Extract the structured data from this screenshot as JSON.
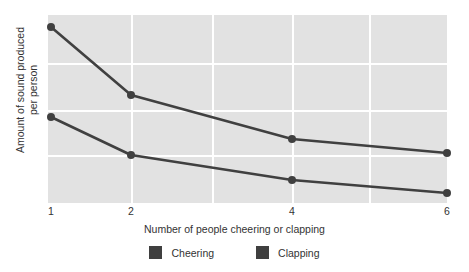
{
  "chart_data": {
    "type": "line",
    "title": "",
    "xlabel": "Number of people cheering or clapping",
    "ylabel": "Amount of sound produced per person",
    "ylabel_line1": "Amount of sound produced",
    "ylabel_line2": "per person",
    "x": [
      1,
      2,
      4,
      6
    ],
    "xticklabels": [
      "1",
      "2",
      "4",
      "6"
    ],
    "yticklabels": [],
    "xlim": [
      1,
      6
    ],
    "ylim": [
      0,
      10
    ],
    "grid": true,
    "legend_position": "bottom",
    "plot_background": "#e2e2e2",
    "gridline_color": "#ffffff",
    "series": [
      {
        "name": "Cheering",
        "color": "#404040",
        "values": [
          9.4,
          5.75,
          3.4,
          2.65
        ],
        "pixel_y": [
          27,
          95,
          139,
          153
        ]
      },
      {
        "name": "Clapping",
        "color": "#404040",
        "values": [
          4.6,
          2.55,
          1.55,
          0.55
        ],
        "pixel_y": [
          117,
          155,
          180,
          193
        ]
      }
    ],
    "xtick_pixel_x": [
      51,
      131,
      292,
      447
    ]
  },
  "legend": {
    "items": [
      {
        "label": "Cheering",
        "color": "#3f3f3f"
      },
      {
        "label": "Clapping",
        "color": "#3f3f3f"
      }
    ]
  },
  "axes": {
    "x_ticks": [
      "1",
      "2",
      "4",
      "6"
    ],
    "x_title": "Number of people cheering or clapping",
    "y_title_line1": "Amount of sound produced",
    "y_title_line2": "per person"
  },
  "gridlines": {
    "horizontal_y": [
      63,
      110,
      155
    ],
    "vertical_x": [
      131,
      212,
      292,
      369
    ]
  }
}
